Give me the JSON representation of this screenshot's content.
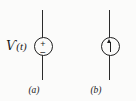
{
  "figure": {
    "background_color": "#fbfbfa",
    "ink_color": "#1e1e1e",
    "width": 136,
    "height": 101
  },
  "symbols": [
    {
      "id": "voltage-source",
      "kind": "independent-voltage-source",
      "label_script": "Ѵ",
      "label_rest": "(t)",
      "label_full": "v(t)",
      "polarity_plus": "+",
      "polarity_minus": "−",
      "caption": "(a)"
    },
    {
      "id": "current-source",
      "kind": "independent-current-source",
      "label_full": "f(t)",
      "arrow_direction": "up",
      "caption": "(b)"
    }
  ]
}
